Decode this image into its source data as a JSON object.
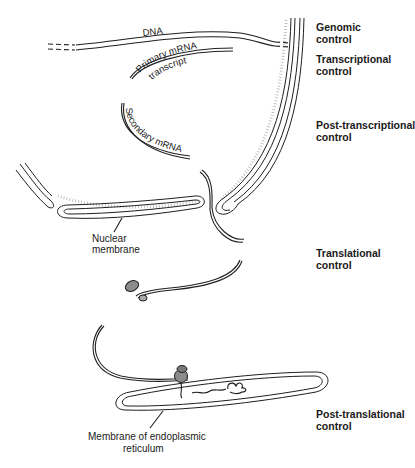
{
  "diagram": {
    "labels": {
      "dna": "DNA",
      "primary_mrna": "Primary mRNA",
      "transcript": "transcript",
      "secondary_mrna": "Secondary mRNA",
      "nuclear_membrane": "Nuclear\nmembrane",
      "er_membrane_line1": "Membrane of endoplasmic",
      "er_membrane_line2": "reticulum"
    },
    "control_levels": [
      {
        "label": "Genomic\ncontrol"
      },
      {
        "label": "Transcriptional\ncontrol"
      },
      {
        "label": "Post-transcriptional\ncontrol"
      },
      {
        "label": "Translational\ncontrol"
      },
      {
        "label": "Post-translational\ncontrol"
      }
    ],
    "colors": {
      "ink": "#1f1f1f",
      "stipple": "#9a9a9a",
      "ribosome": "#8c8c8c"
    }
  }
}
